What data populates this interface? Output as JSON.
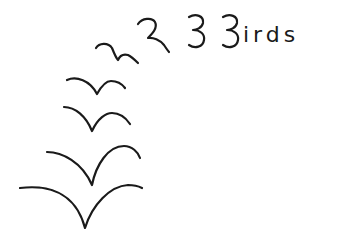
{
  "drawing": {
    "title_suffix": "irds",
    "description": "Hand-drawn sketch of birds morphing into the word 'Birds'",
    "stroke_color": "#1a1a1a",
    "background_color": "#ffffff",
    "bird_count": 6
  }
}
